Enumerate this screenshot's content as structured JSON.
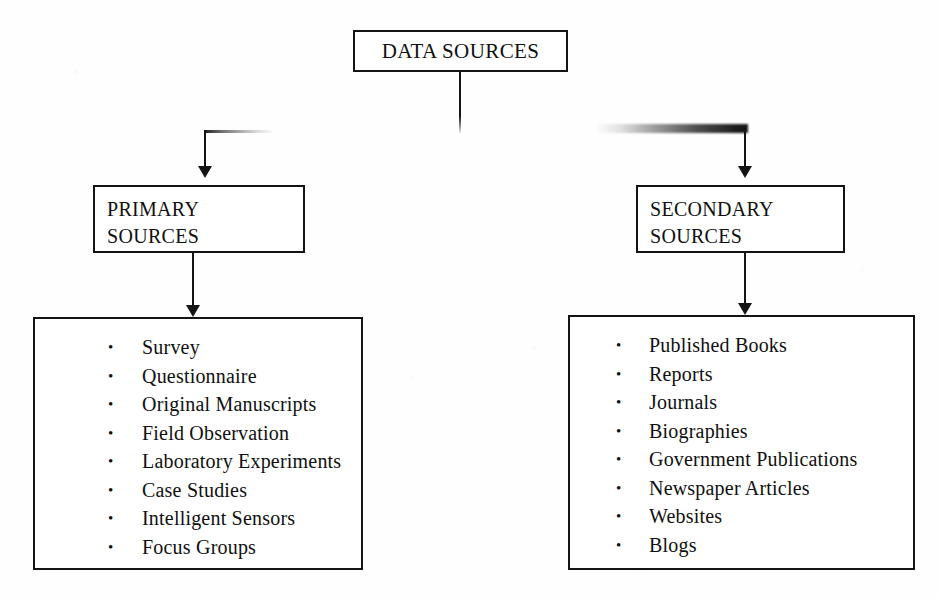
{
  "diagram": {
    "root": {
      "label": "DATA SOURCES"
    },
    "branches": [
      {
        "id": "primary",
        "title_line1": "PRIMARY",
        "title_line2": "SOURCES",
        "items": [
          "Survey",
          "Questionnaire",
          "Original Manuscripts",
          "Field Observation",
          "Laboratory Experiments",
          "Case Studies",
          "Intelligent Sensors",
          "Focus Groups"
        ]
      },
      {
        "id": "secondary",
        "title_line1": "SECONDARY",
        "title_line2": "SOURCES",
        "items": [
          "Published Books",
          "Reports",
          "Journals",
          "Biographies",
          "Government Publications",
          "Newspaper Articles",
          "Websites",
          "Blogs"
        ]
      }
    ],
    "colors": {
      "stroke": "#141414",
      "background": "#fefefe",
      "text": "#101010"
    }
  }
}
